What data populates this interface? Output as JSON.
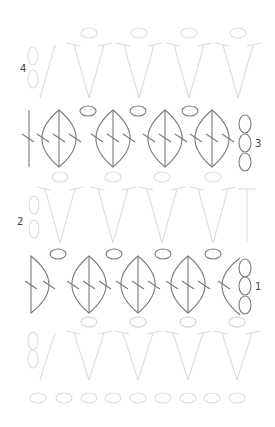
{
  "diagram": {
    "type": "crochet-stitch-chart",
    "row_labels": [
      {
        "text": "4",
        "x": 20,
        "y": 72
      },
      {
        "text": "3",
        "x": 255,
        "y": 147
      },
      {
        "text": "2",
        "x": 17,
        "y": 225
      },
      {
        "text": "1",
        "x": 255,
        "y": 290
      }
    ],
    "colors": {
      "active": "#7a7a7a",
      "faded": "#dcdcdc",
      "label": "#444444"
    },
    "foundation_chain": {
      "y": 398,
      "x": [
        38,
        64,
        89,
        113,
        138,
        163,
        188,
        212,
        237
      ]
    },
    "v_rows": [
      {
        "name": "row-0",
        "top_y": 333,
        "bottom_y": 380,
        "oval_y": 322,
        "turning_chain": {
          "x": 33,
          "y": [
            341,
            359
          ]
        },
        "first_line": {
          "x1": 55,
          "x2": 40
        },
        "v_bottoms": [
          89,
          138,
          188,
          237
        ]
      },
      {
        "name": "row-2",
        "top_y": 189,
        "bottom_y": 243,
        "oval_y": 177,
        "turning_chain": {
          "x": 34,
          "y": [
            205,
            229
          ]
        },
        "first_line": null,
        "v_bottoms": [
          60,
          113,
          162,
          213
        ],
        "last_post_x": 247
      },
      {
        "name": "row-4",
        "top_y": 45,
        "bottom_y": 98,
        "oval_y": 33,
        "turning_chain": {
          "x": 33,
          "y": [
            56,
            79
          ]
        },
        "first_line": {
          "x1": 55,
          "x2": 40
        },
        "v_bottoms": [
          89,
          139,
          189,
          238
        ]
      }
    ],
    "leaf_rows": [
      {
        "name": "row-3",
        "top_y": 110,
        "bottom_y": 167,
        "mid_y": 138,
        "start_post_x": 29,
        "leaf_centers": [
          59,
          113,
          165,
          212
        ],
        "leaf_half_width": 18,
        "ovals": {
          "y": 111,
          "x": [
            88,
            138,
            190
          ]
        },
        "end_chain": {
          "x": 245,
          "y": [
            124,
            143,
            162
          ]
        }
      },
      {
        "name": "row-1",
        "top_y": 256,
        "bottom_y": 313,
        "mid_y": 285,
        "start_half_leaf_x": 31,
        "leaf_centers": [
          89,
          138,
          188
        ],
        "leaf_half_width": 18,
        "ovals": {
          "y": 254,
          "x": [
            58,
            114,
            163,
            213
          ]
        },
        "end_half_leaf_x": 240,
        "end_chain": {
          "x": 245,
          "y": [
            268,
            286,
            305
          ]
        }
      }
    ]
  }
}
